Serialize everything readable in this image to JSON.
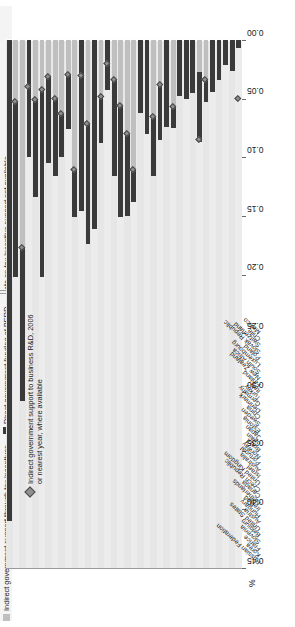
{
  "legend": {
    "items": [
      {
        "key": "indirect",
        "label": "Indirect government support through tax incentives"
      },
      {
        "key": "direct",
        "label": "Direct government funding of BERD"
      },
      {
        "key": "na",
        "label": "Data on tax incentive support not available"
      }
    ]
  },
  "annotation": {
    "marker": "◆",
    "text": "Indirect government support to business R&D, 2006\nor nearest year, where available"
  },
  "axis": {
    "unit_label": "%",
    "ticks": [
      "0.45",
      "0.40",
      "0.35",
      "0.30",
      "0.25",
      "0.20",
      "0.15",
      "0.10",
      "0.05",
      "0.00"
    ]
  },
  "colors": {
    "indirect": "#bfbfbf",
    "direct": "#3a3a3a",
    "diamond": "#8f8f8f",
    "plot_background": "#e9e9e9",
    "gridline": "#fdfdfd"
  },
  "chart_data": {
    "type": "bar",
    "title": "",
    "subtitle": "",
    "xlabel": "%",
    "ylabel": "",
    "xlim": [
      0,
      0.45
    ],
    "grid": true,
    "orientation": "horizontal",
    "stacked": true,
    "legend_position": "top",
    "categories": [
      "Russian Federation",
      "Korea",
      "France",
      "Slovenia",
      "Belgium",
      "United States",
      "Austria",
      "Hungary",
      "Ireland",
      "Netherlands",
      "Canada",
      "Czech Republic",
      "United Kingdom",
      "Israel",
      "Australia",
      "Portugal",
      "Norway",
      "Brazil",
      "Spain",
      "Japan",
      "Estonia",
      "Sweden",
      "China",
      "Denmark",
      "Germany",
      "Turkey",
      "Italy",
      "Finland",
      "New Zealand",
      "South Africa",
      "Luxembourg",
      "Poland",
      "Slovak Republic",
      "Switzerland",
      "Chile",
      "Mexico"
    ],
    "series": [
      {
        "name": "Direct government funding of BERD",
        "color": "#3a3a3a",
        "values": [
          0.41,
          0.15,
          0.131,
          0.1,
          0.083,
          0.16,
          0.074,
          0.066,
          0.037,
          0.047,
          0.041,
          0.146,
          0.103,
          0.161,
          0.04,
          0.043,
          0.082,
          0.095,
          0.07,
          0.028,
          0.062,
          0.08,
          0.051,
          0.047,
          0.074,
          0.018,
          0.048,
          0.05,
          0.045,
          0.06,
          0.019,
          0.044,
          0.034,
          0.021,
          0.026,
          0.007
        ]
      },
      {
        "name": "Indirect government support through tax incentives",
        "color": "#bfbfbf",
        "values": [
          0.0,
          0.052,
          0.177,
          0.0,
          0.051,
          0.042,
          0.031,
          0.05,
          0.063,
          0.029,
          0.11,
          0.0,
          0.071,
          0.0,
          0.048,
          0.0,
          0.034,
          0.056,
          0.08,
          0.11,
          0.0,
          0.0,
          0.065,
          0.038,
          0.0,
          0.057,
          0.0,
          0.0,
          0.0,
          0.027,
          0.034,
          0.0,
          0.0,
          0.0,
          0.0,
          0.0
        ]
      }
    ],
    "no_data_categories": [
      "Slovenia",
      "Israel",
      "Portugal",
      "Estonia",
      "Sweden",
      "Germany",
      "Italy",
      "Finland",
      "New Zealand",
      "Poland",
      "Slovak Republic",
      "Switzerland",
      "Chile",
      "Czech Republic"
    ],
    "indirect_marker": {
      "name": "Indirect government support to business R&D, 2006 or nearest year, where available",
      "symbol": "diamond",
      "values": [
        null,
        0.052,
        0.177,
        0.04,
        0.051,
        0.042,
        0.031,
        0.05,
        0.063,
        0.029,
        0.11,
        0.03,
        0.071,
        null,
        0.048,
        0.02,
        0.034,
        0.056,
        0.08,
        0.11,
        null,
        null,
        0.065,
        0.038,
        null,
        0.057,
        null,
        null,
        null,
        0.085,
        0.034,
        null,
        null,
        null,
        null,
        0.05
      ]
    }
  }
}
